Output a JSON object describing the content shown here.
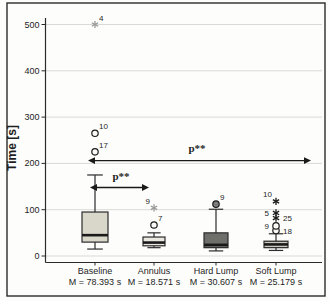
{
  "figure": {
    "width_px": 329,
    "height_px": 301,
    "background": "#fdfdfc",
    "border_color": "#2b2b2b"
  },
  "chart_data": {
    "type": "boxplot",
    "title": "",
    "ylabel": "Time [s]",
    "xlabel": "",
    "yticks": [
      0,
      100,
      200,
      300,
      400,
      500
    ],
    "ylim": [
      -30,
      540
    ],
    "grid": true,
    "grid_color": "#d9d9d6",
    "axis_color": "#2b2b2b",
    "categories": [
      "Baseline",
      "Annulus",
      "Hard Lump",
      "Soft Lump"
    ],
    "category_mean_labels": [
      "M = 78.393 s",
      "M = 18.571 s",
      "M = 30.607 s",
      "M = 25.179 s"
    ],
    "series": [
      {
        "name": "Baseline",
        "mean_label": "M = 78.393 s",
        "whisker_low": 15,
        "q1": 30,
        "median": 45,
        "q3": 95,
        "whisker_high": 175,
        "fill": "#d9d6ca",
        "pattern": "solid",
        "outliers": [
          {
            "type": "circle",
            "value": 225,
            "label": "17",
            "label_side": "above-right"
          },
          {
            "type": "circle",
            "value": 265,
            "label": "10",
            "label_side": "above-right"
          },
          {
            "type": "asterisk",
            "value": 500,
            "label": "4",
            "label_side": "above-right",
            "faint": true
          }
        ]
      },
      {
        "name": "Annulus",
        "mean_label": "M = 18.571 s",
        "whisker_low": 18,
        "q1": 22,
        "median": 29,
        "q3": 41,
        "whisker_high": 50,
        "fill": "#eae8e0",
        "pattern": "solid",
        "outliers": [
          {
            "type": "circle",
            "value": 67,
            "label": "7",
            "label_side": "above-right"
          },
          {
            "type": "asterisk",
            "value": 104,
            "label": "9",
            "label_side": "above-left",
            "faint": true
          }
        ]
      },
      {
        "name": "Hard Lump",
        "mean_label": "M = 30.607 s",
        "whisker_low": 11,
        "q1": 18,
        "median": 24,
        "q3": 50,
        "whisker_high": 101,
        "fill": "#6e6e6a",
        "pattern": "solid",
        "outliers": [
          {
            "type": "circle",
            "value": 112,
            "label": "9",
            "label_side": "above-right",
            "filled": true
          }
        ]
      },
      {
        "name": "Soft Lump",
        "mean_label": "M = 25.179 s",
        "whisker_low": 12,
        "q1": 18,
        "median": 25,
        "q3": 32,
        "whisker_high": 48,
        "fill": "#ccc9bf",
        "pattern": "hlines",
        "outliers": [
          {
            "type": "circle",
            "value": 55,
            "label": "18",
            "label_side": "right"
          },
          {
            "type": "circle",
            "value": 65,
            "label": "9",
            "label_side": "left"
          },
          {
            "type": "asterisk",
            "value": 82,
            "label": "25",
            "label_side": "right"
          },
          {
            "type": "asterisk",
            "value": 93,
            "label": "5",
            "label_side": "left"
          },
          {
            "type": "asterisk",
            "value": 118,
            "label": "10",
            "label_side": "above-left"
          }
        ]
      }
    ],
    "annotations": [
      {
        "text": "p**",
        "type": "double-arrow",
        "between": [
          "Baseline",
          "Soft Lump"
        ],
        "y_value": 206,
        "x1_px": 88,
        "x2_px": 311,
        "label_x_px": 197,
        "label_y_px": 152
      },
      {
        "text": "p**",
        "type": "double-arrow",
        "between": [
          "Baseline",
          "Annulus"
        ],
        "y_value": 148,
        "x1_px": 90,
        "x2_px": 149,
        "label_x_px": 121,
        "label_y_px": 180
      }
    ],
    "layout_hints": {
      "x_centers_px": [
        95,
        154,
        216,
        276
      ],
      "box_widths_px": [
        26,
        22,
        24,
        24
      ],
      "plot_left_px": 45.5,
      "plot_right_px": 322,
      "axis_top_px": 18,
      "axis_bottom_px": 262.5,
      "y_zero_px": 256,
      "px_per_unit": 0.463,
      "border_rect_px": [
        7,
        3,
        318,
        293
      ]
    }
  }
}
